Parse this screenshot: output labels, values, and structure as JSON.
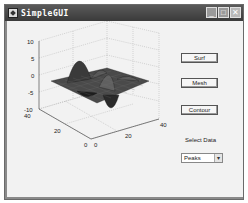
{
  "window": {
    "title": "SimpleGUI",
    "controls": {
      "minimize": "_",
      "maximize": "□",
      "close": "✕"
    }
  },
  "buttons": {
    "surf": "Surf",
    "mesh": "Mesh",
    "contour": "Contour"
  },
  "select_label": "Select Data",
  "dropdown": {
    "selected": "Peaks",
    "arrow": "▾"
  },
  "plot": {
    "z_ticks": [
      "10",
      "5",
      "0",
      "-5",
      "-10"
    ],
    "y_ticks": [
      "40",
      "20",
      "0"
    ],
    "x_ticks": [
      "0",
      "20",
      "40"
    ]
  }
}
